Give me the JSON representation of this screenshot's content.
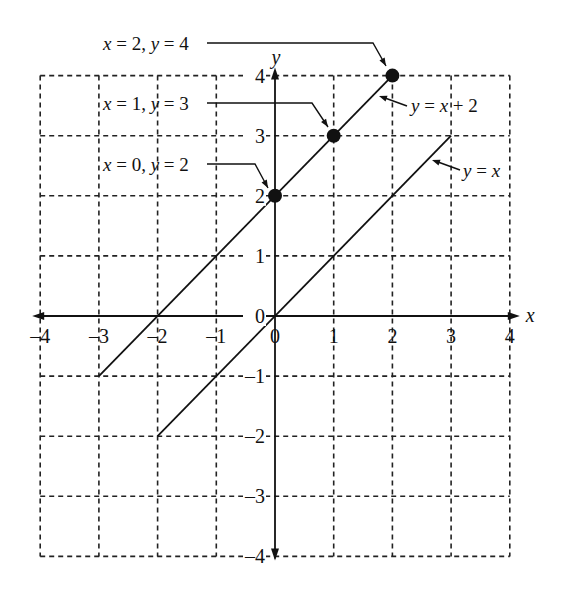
{
  "chart_data": {
    "type": "line",
    "title": "",
    "xlabel": "x",
    "ylabel": "y",
    "xlim": [
      -4,
      4
    ],
    "ylim": [
      -4,
      4
    ],
    "grid": true,
    "grid_style": "dashed",
    "x_ticks": [
      "-4",
      "-3",
      "-2",
      "-1",
      "0",
      "1",
      "2",
      "3",
      "4"
    ],
    "y_ticks": [
      "-4",
      "-3",
      "-2",
      "-1",
      "0",
      "1",
      "2",
      "3",
      "4"
    ],
    "series": [
      {
        "name": "y = x + 2",
        "x": [
          -3,
          2
        ],
        "y": [
          -1,
          4
        ]
      },
      {
        "name": "y = x",
        "x": [
          -2,
          3
        ],
        "y": [
          -2,
          3
        ]
      }
    ],
    "points": [
      {
        "x": 0,
        "y": 2,
        "label": "x = 0, y = 2"
      },
      {
        "x": 1,
        "y": 3,
        "label": "x = 1, y = 3"
      },
      {
        "x": 2,
        "y": 4,
        "label": "x = 2, y = 4"
      }
    ],
    "annotations": [
      {
        "text": "x = 2, y = 4",
        "points_to": [
          2,
          4
        ]
      },
      {
        "text": "x = 1, y = 3",
        "points_to": [
          1,
          3
        ]
      },
      {
        "text": "x = 0, y = 2",
        "points_to": [
          0,
          2
        ]
      },
      {
        "text": "y = x + 2",
        "points_to_series": "y = x + 2"
      },
      {
        "text": "y = x",
        "points_to_series": "y = x"
      }
    ]
  }
}
